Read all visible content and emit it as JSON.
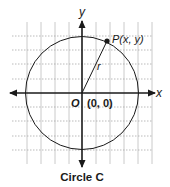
{
  "diagram": {
    "title": "Circle C",
    "axes": {
      "x_label": "x",
      "y_label": "y"
    },
    "origin": {
      "label": "O",
      "coords": "(0, 0)"
    },
    "point": {
      "label": "P(x, y)"
    },
    "radius": {
      "label": "r"
    },
    "colors": {
      "stroke": "#1a1a1a",
      "grid": "#b8b8b8",
      "background": "#ffffff"
    }
  }
}
